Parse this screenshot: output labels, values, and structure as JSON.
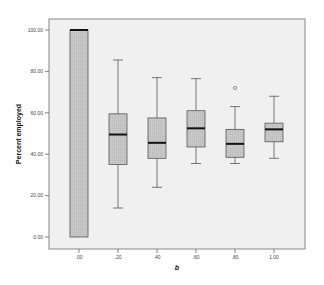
{
  "chart_data": {
    "type": "boxplot",
    "title": "",
    "xlabel": "b",
    "ylabel": "Percent employed",
    "categories": [
      ".00",
      ".20",
      ".40",
      ".60",
      ".80",
      "1.00"
    ],
    "y_ticks": [
      "100.00",
      "80.00",
      "60.00",
      "40.00",
      "20.00",
      "0.00"
    ],
    "y_tick_values": [
      100,
      80,
      60,
      40,
      20,
      0
    ],
    "ylim": [
      -5,
      106
    ],
    "grid": false,
    "legend": null,
    "series": [
      {
        "category": ".00",
        "whisker_low": 0,
        "q1": 0,
        "median": 100,
        "q3": 100,
        "whisker_high": 100,
        "outliers": []
      },
      {
        "category": ".20",
        "whisker_low": 14,
        "q1": 35,
        "median": 49.5,
        "q3": 59.5,
        "whisker_high": 85.5,
        "outliers": []
      },
      {
        "category": ".40",
        "whisker_low": 24,
        "q1": 38,
        "median": 45.5,
        "q3": 57.5,
        "whisker_high": 77,
        "outliers": []
      },
      {
        "category": ".60",
        "whisker_low": 35.5,
        "q1": 43.5,
        "median": 52.5,
        "q3": 61,
        "whisker_high": 76.5,
        "outliers": []
      },
      {
        "category": ".80",
        "whisker_low": 35.5,
        "q1": 38.5,
        "median": 45,
        "q3": 52,
        "whisker_high": 63,
        "outliers": [
          72
        ]
      },
      {
        "category": "1.00",
        "whisker_low": 38,
        "q1": 46,
        "median": 52,
        "q3": 55,
        "whisker_high": 68,
        "outliers": []
      }
    ]
  },
  "colors": {
    "plot_background": "#f0f0f0",
    "box_fill": "#c8c8c8",
    "box_stroke": "#555555",
    "median": "#111111",
    "frame": "#888888"
  }
}
